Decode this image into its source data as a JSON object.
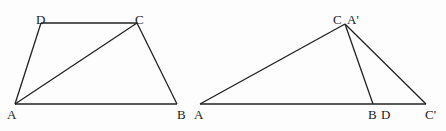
{
  "figures": [
    {
      "name": "trapezoid-ABCD",
      "points": {
        "A": [
          15,
          104
        ],
        "B": [
          177,
          104
        ],
        "C": [
          137,
          23
        ],
        "D": [
          41,
          23
        ]
      },
      "segments": [
        [
          "A",
          "B"
        ],
        [
          "B",
          "C"
        ],
        [
          "C",
          "D"
        ],
        [
          "D",
          "A"
        ],
        [
          "A",
          "C"
        ]
      ],
      "labels": [
        {
          "text": "D",
          "x": 36,
          "y": 13
        },
        {
          "text": "C",
          "x": 135,
          "y": 13
        },
        {
          "text": "A",
          "x": 7,
          "y": 108
        },
        {
          "text": "B",
          "x": 177,
          "y": 108
        }
      ]
    },
    {
      "name": "triangles-overlay",
      "points": {
        "A": [
          200,
          104
        ],
        "CA'": [
          345,
          24
        ],
        "B": [
          373,
          104
        ],
        "C'": [
          426,
          104
        ]
      },
      "segments": [
        [
          "A",
          "C'"
        ],
        [
          "A",
          "CA'"
        ],
        [
          "CA'",
          "B"
        ],
        [
          "CA'",
          "C'"
        ]
      ],
      "labels": [
        {
          "text": "A",
          "x": 194,
          "y": 108
        },
        {
          "text": "C",
          "x": 333,
          "y": 13
        },
        {
          "text": "A'",
          "x": 347,
          "y": 13
        },
        {
          "text": "B",
          "x": 368,
          "y": 108
        },
        {
          "text": "D",
          "x": 381,
          "y": 108
        },
        {
          "text": "C'",
          "x": 425,
          "y": 108
        }
      ]
    }
  ]
}
